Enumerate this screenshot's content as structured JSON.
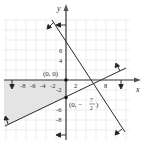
{
  "diagram": {
    "type": "linear-inequality-system-graph",
    "axes": {
      "x_label": "x",
      "y_label": "y",
      "x_tick_labels": [
        "-8",
        "-6",
        "-4",
        "-2",
        "2",
        "8"
      ],
      "y_tick_labels": [
        "6",
        "4",
        "-2",
        "-6",
        "-8"
      ]
    },
    "points": [
      {
        "label": "(0, 0)",
        "x": 0,
        "y": 0
      },
      {
        "label_prefix": "(0, −",
        "label_num": "7",
        "label_den": "2",
        "label_suffix": ")",
        "x": 0,
        "y": -3.5
      }
    ],
    "boundaries": [
      {
        "name": "x-axis boundary",
        "equation": "y = 0",
        "shade_direction": "below"
      },
      {
        "name": "y-axis boundary",
        "equation": "x = 0",
        "shade_direction": "left"
      },
      {
        "name": "rising line",
        "equation": "y = x/2 - 7/2",
        "shade_direction": "above"
      },
      {
        "name": "falling line",
        "equation": "y = -3x/2 + 8",
        "shade_direction": "below-left"
      }
    ],
    "shaded_region": "x ≤ 0, y ≤ 0, y ≥ x/2 − 7/2",
    "colors": {
      "axis": "#333333",
      "line": "#2b2b2b",
      "grid": "#dedede",
      "shade": "#e6e6e6"
    }
  }
}
